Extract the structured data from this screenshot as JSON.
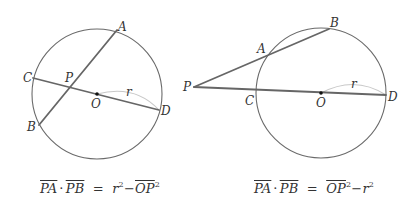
{
  "colors": {
    "circle": "#6a6a6a",
    "segment": "#666666",
    "radius_arc": "#c8c8c8",
    "text": "#333333",
    "background": "#ffffff"
  },
  "figures": [
    {
      "id": "intersecting-chords",
      "circle": {
        "cx": 97,
        "cy": 94,
        "r": 65
      },
      "points": {
        "A": {
          "x": 117,
          "y": 30,
          "label": "A"
        },
        "B": {
          "x": 39,
          "y": 125,
          "label": "B"
        },
        "C": {
          "x": 33,
          "y": 78,
          "label": "C"
        },
        "D": {
          "x": 159,
          "y": 110,
          "label": "D"
        },
        "P": {
          "x": 70,
          "y": 87,
          "label": "P"
        },
        "O": {
          "x": 97,
          "y": 94,
          "label": "O"
        }
      },
      "radius_label": "r",
      "formula": {
        "lhs_1": "PA",
        "dot": "·",
        "lhs_2": "PB",
        "equals": "=",
        "term_1": "r",
        "term_1_exp": "2",
        "minus": "−",
        "term_2": "OP",
        "term_2_exp": "2"
      }
    },
    {
      "id": "secants-from-external-point",
      "circle": {
        "cx": 321,
        "cy": 93,
        "r": 65
      },
      "points": {
        "A": {
          "x": 267,
          "y": 55,
          "label": "A"
        },
        "B": {
          "x": 329,
          "y": 29,
          "label": "B"
        },
        "C": {
          "x": 256,
          "y": 92,
          "label": "C"
        },
        "D": {
          "x": 386,
          "y": 95,
          "label": "D"
        },
        "P": {
          "x": 194,
          "y": 87,
          "label": "P"
        },
        "O": {
          "x": 321,
          "y": 93,
          "label": "O"
        }
      },
      "radius_label": "r",
      "formula": {
        "lhs_1": "PA",
        "dot": "·",
        "lhs_2": "PB",
        "equals": "=",
        "term_1": "OP",
        "term_1_exp": "2",
        "minus": "−",
        "term_2": "r",
        "term_2_exp": "2"
      }
    }
  ]
}
